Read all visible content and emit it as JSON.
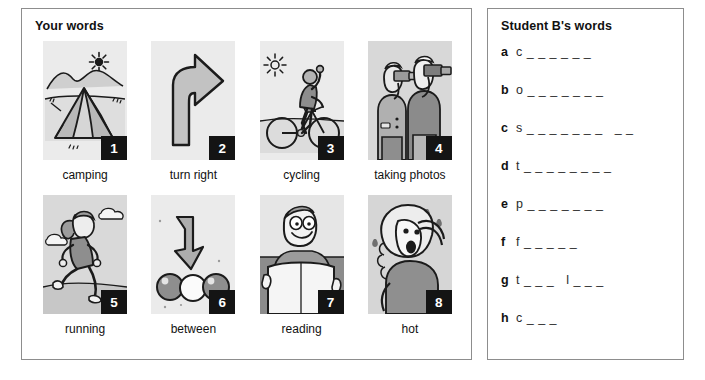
{
  "left_panel": {
    "title": "Your words",
    "items": [
      {
        "number": "1",
        "caption": "camping",
        "icon": "tent-illustration"
      },
      {
        "number": "2",
        "caption": "turn right",
        "icon": "turn-right-arrow-illustration"
      },
      {
        "number": "3",
        "caption": "cycling",
        "icon": "cyclist-illustration"
      },
      {
        "number": "4",
        "caption": "taking photos",
        "icon": "photographers-illustration"
      },
      {
        "number": "5",
        "caption": "running",
        "icon": "runner-illustration"
      },
      {
        "number": "6",
        "caption": "between",
        "icon": "arrow-between-balls-illustration"
      },
      {
        "number": "7",
        "caption": "reading",
        "icon": "man-reading-newspaper-illustration"
      },
      {
        "number": "8",
        "caption": "hot",
        "icon": "hot-woman-sweating-illustration"
      }
    ]
  },
  "right_panel": {
    "title": "Student B's words",
    "items": [
      {
        "letter": "a",
        "blank": "c _ _ _ _ _ _"
      },
      {
        "letter": "b",
        "blank": "o _ _ _ _ _ _ _"
      },
      {
        "letter": "c",
        "blank": "s _ _ _ _ _ _ _   _ _"
      },
      {
        "letter": "d",
        "blank": "t _ _ _ _ _ _ _ _"
      },
      {
        "letter": "e",
        "blank": "p _ _ _ _ _ _ _"
      },
      {
        "letter": "f",
        "blank": "f _ _ _ _ _"
      },
      {
        "letter": "g",
        "blank": "t _ _ _   l _ _ _"
      },
      {
        "letter": "h",
        "blank": "c _ _ _"
      }
    ]
  },
  "colors": {
    "border": "#8d8d8d",
    "badge_background": "#141414",
    "badge_text": "#ffffff",
    "thumb_background": "#ebebeb",
    "ink": "#111111"
  }
}
